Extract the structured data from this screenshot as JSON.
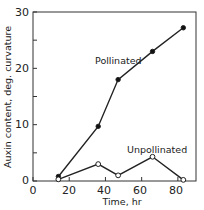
{
  "chart_data": {
    "type": "line",
    "title": "",
    "xlabel": "Time, hr",
    "ylabel": "Auxin content, deg. curvature",
    "xlim": [
      0,
      90
    ],
    "ylim": [
      0,
      30
    ],
    "xticks": [
      0,
      20,
      40,
      60,
      80
    ],
    "yticks": [
      0,
      10,
      20,
      30
    ],
    "yminor_ticks": [
      5,
      15,
      25
    ],
    "grid": false,
    "legend": "inline labels",
    "series": [
      {
        "name": "Pollinated",
        "marker": "filled-circle",
        "x": [
          14,
          36,
          47,
          66,
          83
        ],
        "y": [
          0.8,
          9.7,
          18,
          23,
          27.2
        ]
      },
      {
        "name": "Unpollinated",
        "marker": "open-circle",
        "x": [
          14,
          36,
          47,
          66,
          83
        ],
        "y": [
          0.3,
          3,
          1,
          4.3,
          0.2
        ]
      }
    ],
    "annotations": [
      {
        "text": "Pollinated",
        "x": 53,
        "y": 21.5
      },
      {
        "text": "Unpollinated",
        "x": 62,
        "y": 5.5
      }
    ]
  },
  "labels": {
    "xlabel": "Time, hr",
    "ylabel": "Auxin content, deg. curvature",
    "pollinated": "Pollinated",
    "unpollinated": "Unpollinated",
    "xtick_0": "0",
    "xtick_20": "20",
    "xtick_40": "40",
    "xtick_60": "60",
    "xtick_80": "80",
    "ytick_0": "0",
    "ytick_10": "10",
    "ytick_20": "20",
    "ytick_30": "30"
  }
}
